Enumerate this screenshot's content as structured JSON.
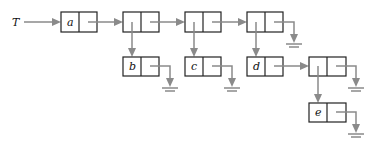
{
  "diagram": {
    "type": "linked-list-structure",
    "root_label": "T",
    "colors": {
      "box_stroke": "#222222",
      "pointer": "#8a8a8a",
      "background": "#ffffff"
    },
    "nodes": [
      {
        "id": "n1",
        "label": "a",
        "x": 61,
        "y": 12
      },
      {
        "id": "n2",
        "label": "",
        "x": 123,
        "y": 12
      },
      {
        "id": "n3",
        "label": "",
        "x": 185,
        "y": 12
      },
      {
        "id": "n4",
        "label": "",
        "x": 247,
        "y": 12
      },
      {
        "id": "nb",
        "label": "b",
        "x": 123,
        "y": 57
      },
      {
        "id": "nc",
        "label": "c",
        "x": 185,
        "y": 57
      },
      {
        "id": "nd",
        "label": "d",
        "x": 247,
        "y": 57
      },
      {
        "id": "n5",
        "label": "",
        "x": 309,
        "y": 57
      },
      {
        "id": "ne",
        "label": "e",
        "x": 309,
        "y": 103
      }
    ],
    "edges": [
      {
        "from": "T",
        "to": "n1"
      },
      {
        "from": "n1",
        "to": "n2"
      },
      {
        "from": "n2",
        "to": "n3"
      },
      {
        "from": "n3",
        "to": "n4"
      },
      {
        "from": "n4",
        "to": "null"
      },
      {
        "from": "n2",
        "to": "nb",
        "kind": "down"
      },
      {
        "from": "n3",
        "to": "nc",
        "kind": "down"
      },
      {
        "from": "n4",
        "to": "nd",
        "kind": "down"
      },
      {
        "from": "nb",
        "to": "null"
      },
      {
        "from": "nc",
        "to": "null"
      },
      {
        "from": "nd",
        "to": "n5"
      },
      {
        "from": "n5",
        "to": "null"
      },
      {
        "from": "n5",
        "to": "ne",
        "kind": "down"
      },
      {
        "from": "ne",
        "to": "null"
      }
    ]
  }
}
